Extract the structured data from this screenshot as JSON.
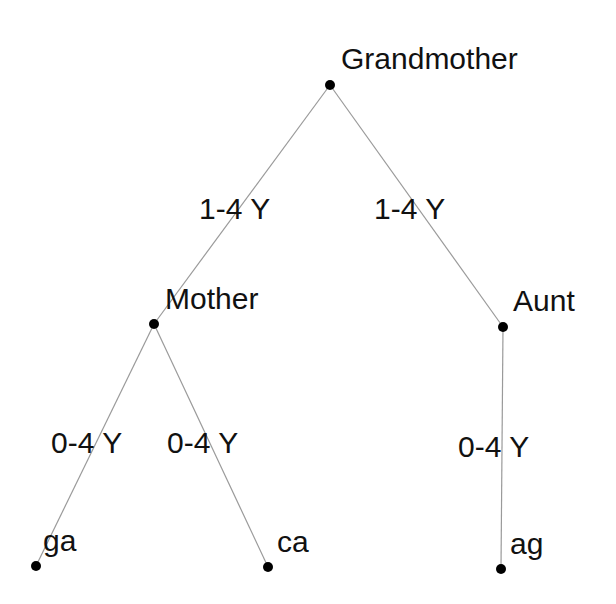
{
  "diagram": {
    "type": "tree",
    "nodes": [
      {
        "id": "grandmother",
        "label": "Grandmother",
        "x": 330,
        "y": 85
      },
      {
        "id": "mother",
        "label": "Mother",
        "x": 154,
        "y": 324
      },
      {
        "id": "aunt",
        "label": "Aunt",
        "x": 503,
        "y": 327
      },
      {
        "id": "ga",
        "label": "ga",
        "x": 36,
        "y": 566
      },
      {
        "id": "ca",
        "label": "ca",
        "x": 268,
        "y": 567
      },
      {
        "id": "ag",
        "label": "ag",
        "x": 501,
        "y": 569
      }
    ],
    "edges": [
      {
        "from": "grandmother",
        "to": "mother",
        "label": "1-4 Y"
      },
      {
        "from": "grandmother",
        "to": "aunt",
        "label": "1-4 Y"
      },
      {
        "from": "mother",
        "to": "ga",
        "label": "0-4 Y"
      },
      {
        "from": "mother",
        "to": "ca",
        "label": "0-4 Y"
      },
      {
        "from": "aunt",
        "to": "ag",
        "label": "0-4 Y"
      }
    ]
  },
  "colors": {
    "edge": "#9a9a9a",
    "node": "#000000",
    "text": "#111111",
    "background": "#ffffff"
  }
}
